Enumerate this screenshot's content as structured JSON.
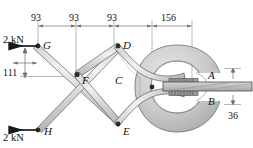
{
  "figure": {
    "type": "engineering-mechanics-free-body-diagram",
    "units": "mm"
  },
  "joints": [
    {
      "id": "G",
      "label": "G"
    },
    {
      "id": "D",
      "label": "D"
    },
    {
      "id": "F",
      "label": "F"
    },
    {
      "id": "C",
      "label": "C"
    },
    {
      "id": "E",
      "label": "E"
    },
    {
      "id": "H",
      "label": "H"
    },
    {
      "id": "A",
      "label": "A"
    },
    {
      "id": "B",
      "label": "B"
    }
  ],
  "dimensions": {
    "horizontal": [
      {
        "value": "93"
      },
      {
        "value": "93"
      },
      {
        "value": "93"
      },
      {
        "value": "156"
      }
    ],
    "vertical_left": {
      "value": "111"
    },
    "vertical_right": {
      "value": "36"
    }
  },
  "forces": [
    {
      "id": "force-top",
      "label": "2 kN",
      "direction": "left",
      "applied_at": "G"
    },
    {
      "id": "force-bottom",
      "label": "2 kN",
      "direction": "left",
      "applied_at": "H"
    }
  ],
  "colors": {
    "line": "#1a1a1a",
    "dimension_line": "#8a8a8a",
    "link_fill_light": "#e2e2e2",
    "link_fill_mid": "#c9c9c9",
    "ring_fill": "#c2c2c2",
    "ring_fill_light": "#d8d8d8",
    "plate_fill": "#bdbdbd",
    "background": "#ffffff"
  }
}
